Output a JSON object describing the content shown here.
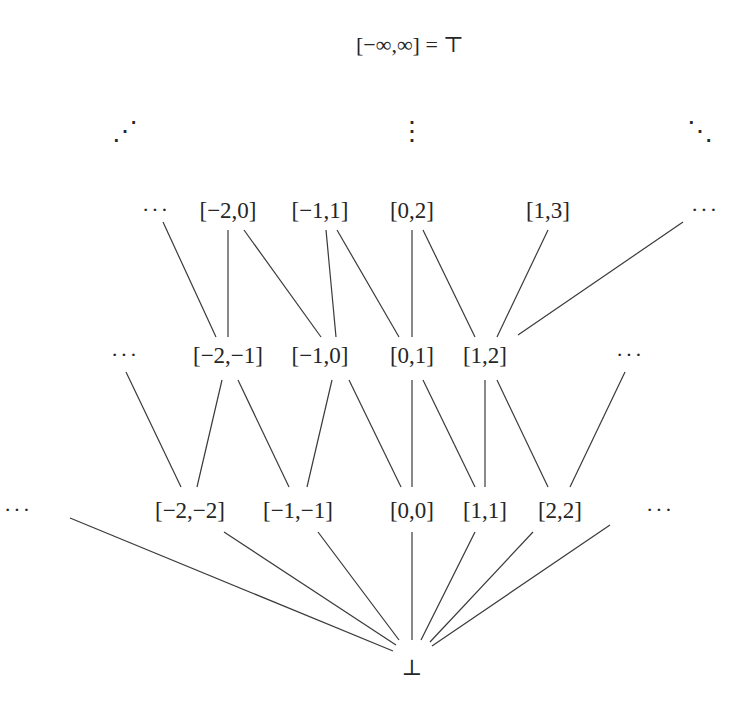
{
  "diagram": {
    "type": "lattice",
    "top": {
      "id": "top",
      "label": "[−∞,∞] = ⊤",
      "x": 410,
      "y": 45
    },
    "bottom": {
      "id": "bottom",
      "label": "⊥",
      "x": 412,
      "y": 668
    },
    "continuations": [
      {
        "id": "cont-up-left",
        "label": "⋰",
        "x": 125,
        "y": 132
      },
      {
        "id": "cont-up-center",
        "label": "⋮",
        "x": 412,
        "y": 132
      },
      {
        "id": "cont-up-right",
        "label": "⋱",
        "x": 700,
        "y": 132
      }
    ],
    "rows": [
      {
        "level": 3,
        "y": 210,
        "nodes": [
          {
            "id": "r3-more-left",
            "label": "···",
            "x": 156
          },
          {
            "id": "n-m2-0",
            "label": "[−2,0]",
            "x": 228
          },
          {
            "id": "n-m1-1",
            "label": "[−1,1]",
            "x": 320
          },
          {
            "id": "n-0-2",
            "label": "[0,2]",
            "x": 412
          },
          {
            "id": "n-1-3",
            "label": "[1,3]",
            "x": 548
          },
          {
            "id": "r3-more-right",
            "label": "···",
            "x": 705
          }
        ]
      },
      {
        "level": 2,
        "y": 355,
        "nodes": [
          {
            "id": "r2-more-left",
            "label": "···",
            "x": 125
          },
          {
            "id": "n-m2-m1",
            "label": "[−2,−1]",
            "x": 228
          },
          {
            "id": "n-m1-0",
            "label": "[−1,0]",
            "x": 320
          },
          {
            "id": "n-0-1",
            "label": "[0,1]",
            "x": 412
          },
          {
            "id": "n-1-2",
            "label": "[1,2]",
            "x": 485
          },
          {
            "id": "r2-more-right",
            "label": "···",
            "x": 630
          }
        ]
      },
      {
        "level": 1,
        "y": 510,
        "nodes": [
          {
            "id": "r1-more-left",
            "label": "···",
            "x": 18
          },
          {
            "id": "n-m2-m2",
            "label": "[−2,−2]",
            "x": 190
          },
          {
            "id": "n-m1-m1",
            "label": "[−1,−1]",
            "x": 298
          },
          {
            "id": "n-0-0",
            "label": "[0,0]",
            "x": 412
          },
          {
            "id": "n-1-1",
            "label": "[1,1]",
            "x": 485
          },
          {
            "id": "n-2-2",
            "label": "[2,2]",
            "x": 560
          },
          {
            "id": "r1-more-right",
            "label": "···",
            "x": 660
          }
        ]
      }
    ],
    "edges": [
      {
        "x1": 163,
        "y1": 222,
        "x2": 216,
        "y2": 337
      },
      {
        "x1": 228,
        "y1": 230,
        "x2": 228,
        "y2": 337
      },
      {
        "x1": 244,
        "y1": 230,
        "x2": 321,
        "y2": 337
      },
      {
        "x1": 326,
        "y1": 230,
        "x2": 336,
        "y2": 337
      },
      {
        "x1": 337,
        "y1": 230,
        "x2": 399,
        "y2": 337
      },
      {
        "x1": 412,
        "y1": 230,
        "x2": 412,
        "y2": 337
      },
      {
        "x1": 423,
        "y1": 230,
        "x2": 475,
        "y2": 337
      },
      {
        "x1": 548,
        "y1": 230,
        "x2": 497,
        "y2": 337
      },
      {
        "x1": 683,
        "y1": 222,
        "x2": 518,
        "y2": 335
      },
      {
        "x1": 126,
        "y1": 372,
        "x2": 181,
        "y2": 487
      },
      {
        "x1": 222,
        "y1": 380,
        "x2": 197,
        "y2": 487
      },
      {
        "x1": 238,
        "y1": 380,
        "x2": 289,
        "y2": 487
      },
      {
        "x1": 332,
        "y1": 380,
        "x2": 307,
        "y2": 487
      },
      {
        "x1": 349,
        "y1": 380,
        "x2": 401,
        "y2": 487
      },
      {
        "x1": 412,
        "y1": 380,
        "x2": 412,
        "y2": 487
      },
      {
        "x1": 423,
        "y1": 380,
        "x2": 475,
        "y2": 487
      },
      {
        "x1": 485,
        "y1": 380,
        "x2": 485,
        "y2": 487
      },
      {
        "x1": 497,
        "y1": 380,
        "x2": 548,
        "y2": 487
      },
      {
        "x1": 625,
        "y1": 372,
        "x2": 570,
        "y2": 487
      },
      {
        "x1": 70,
        "y1": 518,
        "x2": 393,
        "y2": 651
      },
      {
        "x1": 224,
        "y1": 532,
        "x2": 396,
        "y2": 645
      },
      {
        "x1": 318,
        "y1": 532,
        "x2": 399,
        "y2": 640
      },
      {
        "x1": 412,
        "y1": 532,
        "x2": 412,
        "y2": 640
      },
      {
        "x1": 475,
        "y1": 532,
        "x2": 421,
        "y2": 640
      },
      {
        "x1": 533,
        "y1": 532,
        "x2": 430,
        "y2": 642
      },
      {
        "x1": 610,
        "y1": 525,
        "x2": 432,
        "y2": 646
      }
    ]
  }
}
